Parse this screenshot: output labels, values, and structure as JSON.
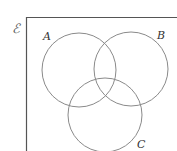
{
  "diagram": {
    "type": "venn",
    "universe": {
      "label": "ℰ",
      "border_color": "#555555"
    },
    "sets": [
      {
        "id": "A",
        "label": "A",
        "cx": 79,
        "cy": 70,
        "r": 37,
        "label_x": 43,
        "label_y": 40
      },
      {
        "id": "B",
        "label": "B",
        "cx": 131,
        "cy": 69,
        "r": 37,
        "label_x": 157,
        "label_y": 39
      },
      {
        "id": "C",
        "label": "C",
        "cx": 105,
        "cy": 115,
        "r": 37,
        "label_x": 137,
        "label_y": 148
      }
    ],
    "stroke_color": "#8a8a8a"
  }
}
